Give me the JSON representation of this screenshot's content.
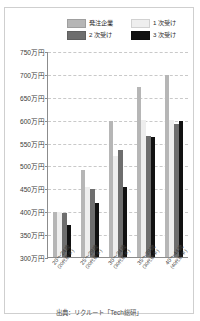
{
  "top_fragment": "",
  "source_note": "出典：リクルート「Tech総研」",
  "legend": {
    "items": [
      {
        "label": "発注企業",
        "color": "#b6b6b6",
        "name": "legend-hacchu-kigyo"
      },
      {
        "label": "1 次受け",
        "color": "#eeeeee",
        "name": "legend-1ji-uke"
      },
      {
        "label": "2 次受け",
        "color": "#6e6e6e",
        "name": "legend-2ji-uke"
      },
      {
        "label": "3 次受け",
        "color": "#111111",
        "name": "legend-3ji-uke"
      }
    ]
  },
  "chart_data": {
    "type": "bar",
    "title": "",
    "xlabel": "",
    "ylabel": "",
    "ylim": [
      300,
      750
    ],
    "ytick_step": 50,
    "yticks": [
      300,
      350,
      400,
      450,
      500,
      550,
      600,
      650,
      700,
      750
    ],
    "ytick_labels": [
      "300万円",
      "350万円",
      "400万円",
      "450万円",
      "500万円",
      "550万円",
      "600万円",
      "650万円",
      "700万円",
      "750万円"
    ],
    "grid": true,
    "legend_position": "top-right",
    "categories": [
      "20～24歳",
      "25～29歳",
      "30～34歳",
      "35～39歳",
      "40～44歳"
    ],
    "category_subs": [
      "(20代前半)",
      "(20代後半)",
      "(30代前半)",
      "(30代後半)",
      "(40代前半)"
    ],
    "series": [
      {
        "name": "発注企業",
        "color": "#b6b6b6",
        "values": [
          398,
          490,
          597,
          672,
          698
        ]
      },
      {
        "name": "1 次受け",
        "color": "#eeeeee",
        "values": [
          398,
          453,
          520,
          600,
          600
        ]
      },
      {
        "name": "2 次受け",
        "color": "#6e6e6e",
        "values": [
          397,
          448,
          533,
          565,
          590
        ]
      },
      {
        "name": "3 次受け",
        "color": "#111111",
        "values": [
          370,
          418,
          452,
          563,
          597
        ]
      }
    ]
  }
}
